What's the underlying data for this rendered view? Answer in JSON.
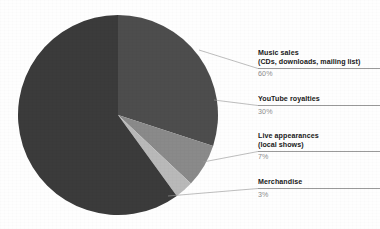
{
  "figure": {
    "name": "revenue-breakdown-pie-chart",
    "background_color": "#fefefe"
  },
  "chart_data": {
    "type": "pie",
    "title": "",
    "subtitle": "",
    "xlabel": "",
    "ylabel": "",
    "legend_position": "callout-right",
    "grid": false,
    "total": 100,
    "units": "%",
    "categories": [
      "Music sales (CDs, downloads, mailing list)",
      "YouTube royalties",
      "Live appearances (local shows)",
      "Merchandise"
    ],
    "values": [
      60,
      30,
      7,
      3
    ],
    "colors": [
      "#3a3a3a",
      "#4d4d4d",
      "#8a8a8a",
      "#b9b9b9"
    ],
    "slices": [
      {
        "label": "Music sales",
        "sublabel": "(CDs, downloads, mailing list)",
        "percent_text": "60%",
        "value": 60,
        "color": "#3a3a3a"
      },
      {
        "label": "YouTube royalties",
        "sublabel": "",
        "percent_text": "30%",
        "value": 30,
        "color": "#4d4d4d"
      },
      {
        "label": "Live appearances",
        "sublabel": "(local shows)",
        "percent_text": "7%",
        "value": 7,
        "color": "#8a8a8a"
      },
      {
        "label": "Merchandise",
        "sublabel": "",
        "percent_text": "3%",
        "value": 3,
        "color": "#b9b9b9"
      }
    ]
  },
  "callouts": {
    "music": {
      "title": "Music sales",
      "subtitle": "(CDs, downloads, mailing list)",
      "percent": "60%"
    },
    "youtube": {
      "title": "YouTube royalties",
      "subtitle": "",
      "percent": "30%"
    },
    "live": {
      "title": "Live appearances",
      "subtitle": "(local shows)",
      "percent": "7%"
    },
    "merchandise": {
      "title": "Merchandise",
      "subtitle": "",
      "percent": "3%"
    }
  }
}
